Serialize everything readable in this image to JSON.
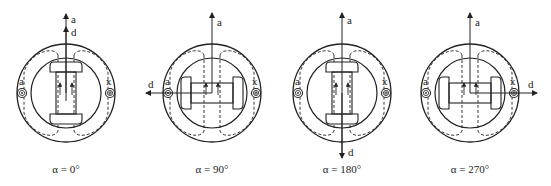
{
  "diagram": {
    "axis_labels": {
      "a_axis": "a",
      "d_axis": "d"
    },
    "coil_labels": {
      "start": "a",
      "end": "x"
    },
    "figures": [
      {
        "id": "fig-0",
        "angle_label": "α = 0°",
        "cx": 66,
        "d_direction": "up"
      },
      {
        "id": "fig-90",
        "angle_label": "α = 90°",
        "cx": 212,
        "d_direction": "left"
      },
      {
        "id": "fig-180",
        "angle_label": "α = 180°",
        "cx": 342,
        "d_direction": "down"
      },
      {
        "id": "fig-270",
        "angle_label": "α = 270°",
        "cx": 470,
        "d_direction": "right"
      }
    ]
  }
}
